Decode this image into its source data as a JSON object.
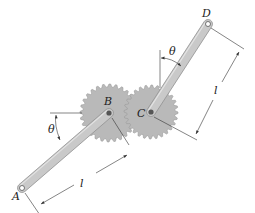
{
  "diagram": {
    "type": "mechanism",
    "colors": {
      "gear_fill": "#b9b9b9",
      "gear_edge": "#9a9a9a",
      "link_fill": "#c9c9c9",
      "link_edge": "#8f8f8f",
      "line": "#333333",
      "pin": "#555555"
    },
    "points": {
      "A": {
        "label": "A",
        "x": 22,
        "y": 188
      },
      "B": {
        "label": "B",
        "x": 109,
        "y": 113
      },
      "C": {
        "label": "C",
        "x": 151,
        "y": 112
      },
      "D": {
        "label": "D",
        "x": 208,
        "y": 24
      }
    },
    "gears": [
      {
        "name": "gear-B",
        "center": "B",
        "radius": 29,
        "teeth": 28
      },
      {
        "name": "gear-C",
        "center": "C",
        "radius": 27,
        "teeth": 28
      }
    ],
    "links": [
      {
        "name": "link-AB",
        "from": "A",
        "to": "B"
      },
      {
        "name": "link-CD",
        "from": "C",
        "to": "D"
      }
    ],
    "angles": [
      {
        "name": "theta-left",
        "label": "θ"
      },
      {
        "name": "theta-top",
        "label": "θ"
      }
    ],
    "dimensions": [
      {
        "name": "dim-AB",
        "label": "l"
      },
      {
        "name": "dim-CD",
        "label": "l"
      }
    ]
  }
}
